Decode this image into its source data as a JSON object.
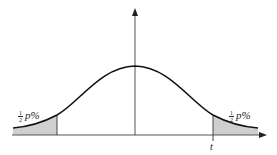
{
  "diagram": {
    "type": "normal-distribution-two-tailed",
    "left_tail_label": {
      "fraction_num": "1",
      "fraction_den": "2",
      "text": "p%"
    },
    "right_tail_label": {
      "fraction_num": "1",
      "fraction_den": "2",
      "text": "p%"
    },
    "cutoff_label": "t",
    "colors": {
      "curve": "#111111",
      "axis": "#444444",
      "shade": "#cfcfcf"
    }
  }
}
